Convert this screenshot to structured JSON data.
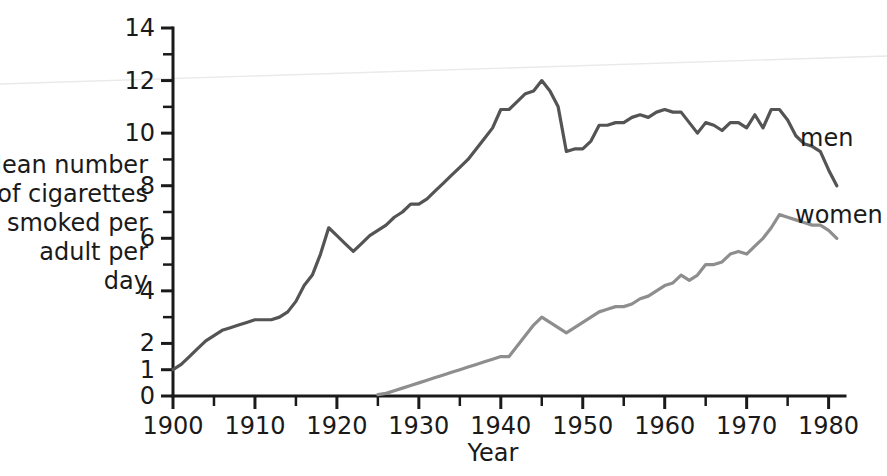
{
  "chart_data": {
    "type": "line",
    "title": "",
    "xlabel": "Year",
    "ylabel": "Mean number of cigarettes smoked per adult per day",
    "ylabel_lines": [
      "Mean number",
      "of cigarettes",
      "smoked per",
      "adult per",
      "day"
    ],
    "xlim": [
      1900,
      1982
    ],
    "ylim": [
      0,
      14
    ],
    "grid": false,
    "legend_position": "inline-right",
    "x_tick_labels": [
      "1900",
      "1910",
      "1920",
      "1930",
      "1940",
      "1950",
      "1960",
      "1970",
      "1980"
    ],
    "x_tick_values": [
      1900,
      1910,
      1920,
      1930,
      1940,
      1950,
      1960,
      1970,
      1980
    ],
    "x_minor_ticks": [
      1905,
      1915,
      1925,
      1935,
      1945,
      1955,
      1965,
      1975
    ],
    "y_tick_labels": [
      "0",
      "1",
      "2",
      "4",
      "6",
      "8",
      "10",
      "12",
      "14"
    ],
    "y_tick_values": [
      0,
      1,
      2,
      4,
      6,
      8,
      10,
      12,
      14
    ],
    "y_minor_ticks": [
      3,
      5,
      7,
      9,
      11,
      13
    ],
    "series": [
      {
        "name": "men",
        "label": "men",
        "color": "#545454",
        "stroke_width": 3.2,
        "x": [
          1900,
          1901,
          1902,
          1903,
          1904,
          1905,
          1906,
          1907,
          1908,
          1909,
          1910,
          1911,
          1912,
          1913,
          1914,
          1915,
          1916,
          1917,
          1918,
          1919,
          1920,
          1921,
          1922,
          1923,
          1924,
          1925,
          1926,
          1927,
          1928,
          1929,
          1930,
          1931,
          1932,
          1933,
          1934,
          1935,
          1936,
          1937,
          1938,
          1939,
          1940,
          1941,
          1942,
          1943,
          1944,
          1945,
          1946,
          1947,
          1948,
          1949,
          1950,
          1951,
          1952,
          1953,
          1954,
          1955,
          1956,
          1957,
          1958,
          1959,
          1960,
          1961,
          1962,
          1963,
          1964,
          1965,
          1966,
          1967,
          1968,
          1969,
          1970,
          1971,
          1972,
          1973,
          1974,
          1975,
          1976,
          1977,
          1978,
          1979,
          1980,
          1981
        ],
        "y": [
          1.0,
          1.2,
          1.5,
          1.8,
          2.1,
          2.3,
          2.5,
          2.6,
          2.7,
          2.8,
          2.9,
          2.9,
          2.9,
          3.0,
          3.2,
          3.6,
          4.2,
          4.6,
          5.4,
          6.4,
          6.1,
          5.8,
          5.5,
          5.8,
          6.1,
          6.3,
          6.5,
          6.8,
          7.0,
          7.3,
          7.3,
          7.5,
          7.8,
          8.1,
          8.4,
          8.7,
          9.0,
          9.4,
          9.8,
          10.2,
          10.9,
          10.9,
          11.2,
          11.5,
          11.6,
          12.0,
          11.6,
          11.0,
          9.3,
          9.4,
          9.4,
          9.7,
          10.3,
          10.3,
          10.4,
          10.4,
          10.6,
          10.7,
          10.6,
          10.8,
          10.9,
          10.8,
          10.8,
          10.4,
          10.0,
          10.4,
          10.3,
          10.1,
          10.4,
          10.4,
          10.2,
          10.7,
          10.2,
          10.9,
          10.9,
          10.5,
          9.9,
          9.6,
          9.5,
          9.3,
          8.6,
          8.0
        ]
      },
      {
        "name": "women",
        "label": "women",
        "color": "#8e8e8e",
        "stroke_width": 3.2,
        "x": [
          1925,
          1926,
          1927,
          1928,
          1929,
          1930,
          1931,
          1932,
          1933,
          1934,
          1935,
          1936,
          1937,
          1938,
          1939,
          1940,
          1941,
          1942,
          1943,
          1944,
          1945,
          1946,
          1947,
          1948,
          1949,
          1950,
          1951,
          1952,
          1953,
          1954,
          1955,
          1956,
          1957,
          1958,
          1959,
          1960,
          1961,
          1962,
          1963,
          1964,
          1965,
          1966,
          1967,
          1968,
          1969,
          1970,
          1971,
          1972,
          1973,
          1974,
          1975,
          1976,
          1977,
          1978,
          1979,
          1980,
          1981
        ],
        "y": [
          0.05,
          0.1,
          0.2,
          0.3,
          0.4,
          0.5,
          0.6,
          0.7,
          0.8,
          0.9,
          1.0,
          1.1,
          1.2,
          1.3,
          1.4,
          1.5,
          1.5,
          1.9,
          2.3,
          2.7,
          3.0,
          2.8,
          2.6,
          2.4,
          2.6,
          2.8,
          3.0,
          3.2,
          3.3,
          3.4,
          3.4,
          3.5,
          3.7,
          3.8,
          4.0,
          4.2,
          4.3,
          4.6,
          4.4,
          4.6,
          5.0,
          5.0,
          5.1,
          5.4,
          5.5,
          5.4,
          5.7,
          6.0,
          6.4,
          6.9,
          6.8,
          6.7,
          6.6,
          6.5,
          6.5,
          6.3,
          6.0
        ]
      }
    ]
  },
  "axes": {
    "x_axis_title": "Year",
    "y_axis_title_lines": [
      "Mean number",
      "of cigarettes",
      "smoked per",
      "adult per",
      "day"
    ]
  }
}
